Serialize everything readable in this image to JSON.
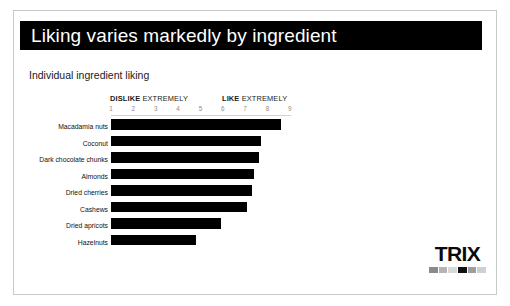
{
  "slide": {
    "title": "Liking varies markedly by ingredient",
    "subtitle": "Individual ingredient liking",
    "title_bar_color": "#000000",
    "background_color": "#ffffff"
  },
  "scale": {
    "left_bold": "DISLIKE",
    "left_rest": " EXTREMELY",
    "right_bold": "LIKE",
    "right_rest": " EXTREMELY"
  },
  "logo": {
    "wordmark": "TRIX",
    "swatches": [
      "#8a8a8a",
      "#b4b4b4",
      "#d8d8d8",
      "#111111",
      "#9e9e9e",
      "#cfcfcf"
    ]
  },
  "chart_data": {
    "type": "bar",
    "orientation": "horizontal",
    "title": "Individual ingredient liking",
    "xlabel": "",
    "ylabel": "",
    "xlim": [
      1,
      9
    ],
    "grid": false,
    "legend": null,
    "bar_color": "#000000",
    "tick_labels": [
      "1",
      "2",
      "3",
      "4",
      "5",
      "6",
      "7",
      "8",
      "9"
    ],
    "axis_annotations": {
      "left": "DISLIKE EXTREMELY",
      "right": "LIKE EXTREMELY"
    },
    "categories": [
      "Macadamia nuts",
      "Coconut",
      "Dark chocolate chunks",
      "Almonds",
      "Dried cherries",
      "Cashews",
      "Dried apricots",
      "Hazelnuts"
    ],
    "values": [
      8.6,
      7.7,
      7.6,
      7.4,
      7.3,
      7.1,
      5.9,
      4.8
    ]
  }
}
